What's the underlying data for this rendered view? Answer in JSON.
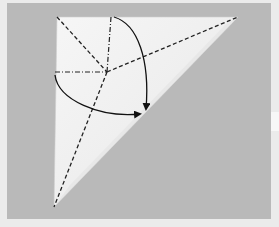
{
  "diagram": {
    "type": "origami-fold-step",
    "colors": {
      "background_outer": "#ebebeb",
      "background_panel": "#b9b9b9",
      "paper_light": "#f4f4f4",
      "paper_shade": "#dcdcdc",
      "line": "#222222"
    },
    "paper": {
      "shape": "kite",
      "points": [
        [
          57,
          17
        ],
        [
          238,
          17
        ],
        [
          54,
          207
        ]
      ]
    },
    "center": [
      107,
      72
    ],
    "creases": [
      {
        "name": "valley-diagonal-left",
        "style": "dashed",
        "from": [
          57,
          17
        ],
        "to": [
          107,
          72
        ]
      },
      {
        "name": "mountain-vertical",
        "style": "dash-dot",
        "from": [
          111,
          17
        ],
        "to": [
          107,
          72
        ]
      },
      {
        "name": "mountain-horizontal",
        "style": "dash-dot",
        "from": [
          55,
          72
        ],
        "to": [
          107,
          72
        ]
      },
      {
        "name": "valley-to-right-tip",
        "style": "dashed",
        "from": [
          107,
          72
        ],
        "to": [
          238,
          17
        ]
      },
      {
        "name": "valley-to-bottom-tip",
        "style": "dashed",
        "from": [
          107,
          72
        ],
        "to": [
          54,
          207
        ]
      }
    ],
    "arrows": [
      {
        "name": "fold-arrow-top",
        "from": [
          114,
          17
        ],
        "to": [
          146,
          109
        ]
      },
      {
        "name": "fold-arrow-left",
        "from": [
          55,
          75
        ],
        "to": [
          140,
          114
        ]
      }
    ]
  }
}
